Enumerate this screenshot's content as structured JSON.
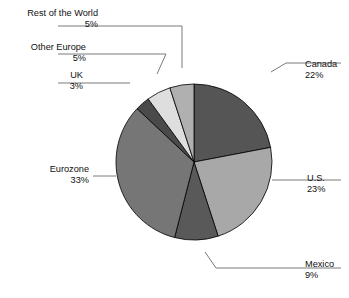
{
  "chart_data": {
    "type": "pie",
    "title": "",
    "subtitle": "",
    "xlabel": "",
    "ylabel": "",
    "legend_position": "none",
    "grid": false,
    "label_format": "name + percent",
    "units": "percent",
    "total": 100,
    "start_angle_deg": 0,
    "direction": "clockwise",
    "categories": [
      "Canada",
      "U.S.",
      "Mexico",
      "Eurozone",
      "UK",
      "Other Europe",
      "Rest of the World"
    ],
    "values": [
      22,
      23,
      9,
      33,
      3,
      5,
      5
    ],
    "slices": [
      {
        "name": "Canada",
        "value": 22,
        "percent_label": "22%",
        "color": "#555555",
        "label_side": "right",
        "label_x": 305,
        "label_y": 67,
        "pct_x": 305,
        "pct_y": 78,
        "leader": "M 271 72 L 286 63 L 341 63"
      },
      {
        "name": "U.S.",
        "value": 23,
        "percent_label": "23%",
        "color": "#a8a8a8",
        "label_side": "right",
        "label_x": 307,
        "label_y": 181,
        "pct_x": 307,
        "pct_y": 192,
        "leader": "M 272 180 L 341 180"
      },
      {
        "name": "Mexico",
        "value": 9,
        "percent_label": "9%",
        "color": "#595959",
        "label_side": "right",
        "label_x": 305,
        "label_y": 267,
        "pct_x": 305,
        "pct_y": 278,
        "leader": "M 205 252 L 216 268 L 341 268"
      },
      {
        "name": "Eurozone",
        "value": 33,
        "percent_label": "33%",
        "color": "#767676",
        "label_side": "left",
        "label_x": 89,
        "label_y": 172,
        "pct_x": 89,
        "pct_y": 183,
        "leader": "M 116 176 L 93 176"
      },
      {
        "name": "UK",
        "value": 3,
        "percent_label": "3%",
        "color": "#4a4a4a",
        "label_side": "left",
        "label_x": 83,
        "label_y": 78,
        "pct_x": 83,
        "pct_y": 89,
        "leader": "M 130 83 L 58 83"
      },
      {
        "name": "Other Europe",
        "value": 5,
        "percent_label": "5%",
        "color": "#dedede",
        "label_side": "left",
        "label_x": 86,
        "label_y": 50,
        "pct_x": 86,
        "pct_y": 61,
        "leader": "M 157 74 L 166 54 L 58 54"
      },
      {
        "name": "Rest of the World",
        "value": 5,
        "percent_label": "5%",
        "color": "#b0b0b0",
        "label_side": "left",
        "label_x": 98,
        "label_y": 16,
        "pct_x": 98,
        "pct_y": 27,
        "leader": "M 182 68 L 182 26 L 58 26"
      }
    ],
    "geometry": {
      "center_x": 194,
      "center_y": 162,
      "radius": 78
    },
    "colors": {
      "outline": "#000000",
      "leader": "#6b6b6b",
      "text": "#101010",
      "background": "#ffffff"
    }
  }
}
